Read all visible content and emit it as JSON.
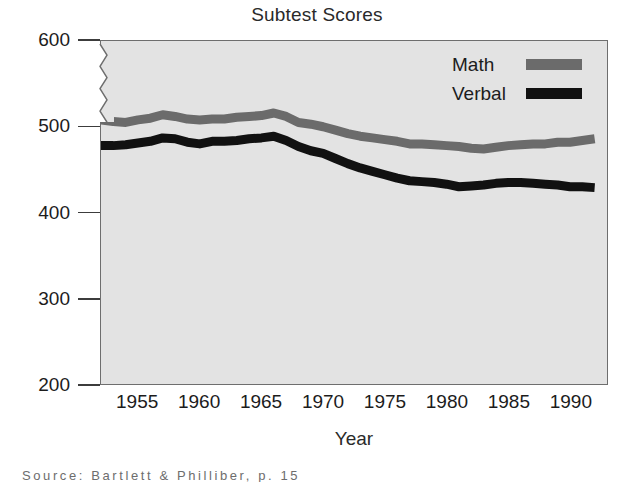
{
  "chart_data": {
    "type": "line",
    "title": "Subtest Scores",
    "xlabel": "Year",
    "ylabel": "",
    "xlim": [
      1952,
      1993
    ],
    "ylim": [
      200,
      600
    ],
    "y_axis_break": true,
    "y_break_between": [
      500,
      600
    ],
    "grid": false,
    "legend_position": "top-right",
    "yticks": [
      200,
      300,
      400,
      500,
      600
    ],
    "ytick_labels": [
      "200",
      "300",
      "400",
      "500",
      "600"
    ],
    "xticks": [
      1955,
      1960,
      1965,
      1970,
      1975,
      1980,
      1985,
      1990
    ],
    "xtick_labels": [
      "1955",
      "1960",
      "1965",
      "1970",
      "1975",
      "1980",
      "1985",
      "1990"
    ],
    "x": [
      1952,
      1953,
      1954,
      1955,
      1956,
      1957,
      1958,
      1959,
      1960,
      1961,
      1962,
      1963,
      1964,
      1965,
      1966,
      1967,
      1968,
      1969,
      1970,
      1971,
      1972,
      1973,
      1974,
      1975,
      1976,
      1977,
      1978,
      1979,
      1980,
      1981,
      1982,
      1983,
      1984,
      1985,
      1986,
      1987,
      1988,
      1989,
      1990,
      1991,
      1992
    ],
    "series": [
      {
        "name": "Math",
        "color": "#6b6b6b",
        "values": [
          508,
          506,
          505,
          508,
          510,
          514,
          512,
          509,
          508,
          509,
          509,
          511,
          512,
          513,
          516,
          512,
          505,
          503,
          500,
          496,
          492,
          489,
          487,
          485,
          483,
          480,
          480,
          479,
          478,
          477,
          475,
          474,
          476,
          478,
          479,
          480,
          480,
          482,
          482,
          484,
          486
        ]
      },
      {
        "name": "Verbal",
        "color": "#111111",
        "values": [
          478,
          478,
          479,
          481,
          483,
          487,
          486,
          482,
          480,
          483,
          483,
          484,
          486,
          487,
          489,
          484,
          477,
          472,
          469,
          463,
          457,
          452,
          448,
          444,
          440,
          437,
          436,
          435,
          433,
          430,
          431,
          432,
          434,
          435,
          435,
          434,
          433,
          432,
          430,
          430,
          429
        ]
      }
    ]
  },
  "legend": {
    "items": [
      {
        "label": "Math",
        "color": "#6b6b6b"
      },
      {
        "label": "Verbal",
        "color": "#111111"
      }
    ]
  },
  "caption": {
    "text": "Source:   Bartlett & Philliber, p. 15"
  },
  "colors": {
    "plot_background": "#e3e3e3",
    "plot_border": "#6e6e6e",
    "page_background": "#ffffff",
    "text": "#1c1c1c",
    "math_line": "#6b6b6b",
    "verbal_line": "#111111"
  }
}
